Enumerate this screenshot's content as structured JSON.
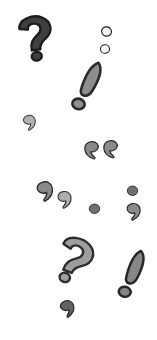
{
  "image": {
    "title": "Scattered punctuation marks illustration",
    "width": 157,
    "height": 340,
    "background_color": "#ffffff",
    "description": "A vertical white panel scattered with hand-drawn punctuation marks: question marks, exclamation marks, quotation marks, commas and dots, in shades of gray with dark outlines.",
    "palette": {
      "background": "#ffffff",
      "dark_fill": "#3a3a3a",
      "dark_outline": "#1c1c1c",
      "mid_fill": "#8c8c8c",
      "mid_outline": "#2b2b2b",
      "light_fill": "#b5b5b5",
      "light_outline": "#333333",
      "hollow_fill": "#f2f2f2",
      "hollow_outline": "#1e1e1e"
    }
  },
  "marks": [
    {
      "id": "question-mark-dark",
      "name": "question-mark",
      "symbol": "?",
      "tone": "dark",
      "fill": "#3f3f3f",
      "stroke": "#1b1b1b",
      "x": 13,
      "y": 13,
      "size": 46,
      "rotation": -8
    },
    {
      "id": "colon-hollow-upper",
      "name": "hollow-dot-upper",
      "symbol": "°",
      "tone": "hollow",
      "fill": "#f4f4f4",
      "stroke": "#1e1e1e",
      "x": 100,
      "y": 25,
      "size": 13,
      "rotation": 12
    },
    {
      "id": "colon-hollow-lower",
      "name": "hollow-dot-lower",
      "symbol": "°",
      "tone": "hollow",
      "fill": "#f4f4f4",
      "stroke": "#1e1e1e",
      "x": 99,
      "y": 43,
      "size": 12,
      "rotation": -6
    },
    {
      "id": "exclamation-mid-upper",
      "name": "exclamation-mark",
      "symbol": "!",
      "tone": "mid",
      "fill": "#8e8e8e",
      "stroke": "#2a2a2a",
      "x": 62,
      "y": 58,
      "size": 52,
      "rotation": 14
    },
    {
      "id": "comma-small-left",
      "name": "comma-small",
      "symbol": ",",
      "tone": "light",
      "fill": "#b0b0b0",
      "stroke": "#343434",
      "x": 21,
      "y": 114,
      "size": 17,
      "rotation": -12
    },
    {
      "id": "quote-open-left",
      "name": "opening-quote-left",
      "symbol": "“",
      "tone": "mid",
      "fill": "#8a8a8a",
      "stroke": "#282828",
      "x": 82,
      "y": 140,
      "size": 20,
      "rotation": 0
    },
    {
      "id": "quote-open-right",
      "name": "opening-quote-right",
      "symbol": "“",
      "tone": "mid",
      "fill": "#8a8a8a",
      "stroke": "#282828",
      "x": 101,
      "y": 139,
      "size": 20,
      "rotation": 0
    },
    {
      "id": "comma-mid-left",
      "name": "closing-comma-large",
      "symbol": ",",
      "tone": "mid",
      "fill": "#8a8a8a",
      "stroke": "#272727",
      "x": 34,
      "y": 180,
      "size": 22,
      "rotation": -14
    },
    {
      "id": "comma-light-right",
      "name": "closing-comma-small",
      "symbol": ",",
      "tone": "light",
      "fill": "#adadad",
      "stroke": "#343434",
      "x": 55,
      "y": 190,
      "size": 19,
      "rotation": -10
    },
    {
      "id": "dot-center",
      "name": "period-dot-center",
      "symbol": ".",
      "tone": "mid",
      "fill": "#6f6f6f",
      "stroke": "#262626",
      "x": 88,
      "y": 202,
      "size": 13,
      "rotation": 0
    },
    {
      "id": "dot-right",
      "name": "period-dot-right",
      "symbol": ".",
      "tone": "mid",
      "fill": "#6f6f6f",
      "stroke": "#262626",
      "x": 126,
      "y": 184,
      "size": 13,
      "rotation": 0
    },
    {
      "id": "comma-right",
      "name": "comma-right-edge",
      "symbol": ",",
      "tone": "mid",
      "fill": "#8a8a8a",
      "stroke": "#272727",
      "x": 124,
      "y": 202,
      "size": 19,
      "rotation": -8
    },
    {
      "id": "question-mark-light",
      "name": "question-mark-rotated",
      "symbol": "?",
      "tone": "light",
      "fill": "#9e9e9e",
      "stroke": "#2d2d2d",
      "x": 48,
      "y": 234,
      "size": 48,
      "rotation": 22
    },
    {
      "id": "exclamation-mid-lower",
      "name": "exclamation-mark-lower",
      "symbol": "!",
      "tone": "mid",
      "fill": "#868686",
      "stroke": "#272727",
      "x": 108,
      "y": 247,
      "size": 50,
      "rotation": 10
    },
    {
      "id": "comma-dark-bottom",
      "name": "comma-bottom",
      "symbol": ",",
      "tone": "dark",
      "fill": "#636363",
      "stroke": "#1f1f1f",
      "x": 58,
      "y": 299,
      "size": 19,
      "rotation": -18
    }
  ]
}
